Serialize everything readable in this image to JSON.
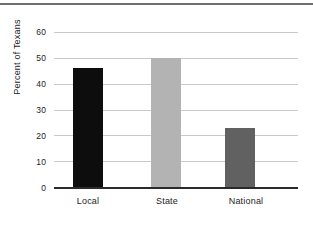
{
  "chart_data": {
    "type": "bar",
    "title": "",
    "subtitle": "",
    "xlabel": "",
    "ylabel": "Percent of Texans",
    "categories": [
      "Local",
      "State",
      "National"
    ],
    "values": [
      46,
      50,
      23
    ],
    "series": [
      {
        "name": "Percent of Texans",
        "values": [
          46,
          50,
          23
        ]
      }
    ],
    "bar_colors": [
      "#0d0d0d",
      "#b3b3b3",
      "#616161"
    ],
    "ylim": [
      0,
      60
    ],
    "ytick_labels": [
      "0",
      "10",
      "20",
      "30",
      "40",
      "50",
      "60"
    ],
    "ytick_values": [
      0,
      10,
      20,
      30,
      40,
      50,
      60
    ],
    "grid": "horizontal",
    "legend": "none",
    "annotations": [],
    "axis_color": "#2a2a2a",
    "gridline_color": "#c9c9c9",
    "background_color": "#ffffff",
    "top_rule_color": "#6e6e6e"
  }
}
